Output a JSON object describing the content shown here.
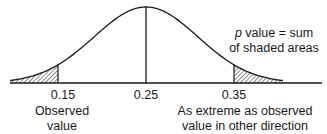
{
  "diagram": {
    "type": "normal-distribution-two-tailed-p-value",
    "ticks": [
      {
        "label": "0.15",
        "x": 58
      },
      {
        "label": "0.25",
        "x": 146
      },
      {
        "label": "0.35",
        "x": 234
      }
    ],
    "annotation": {
      "p_symbol": "p",
      "line1_rest": " value = sum",
      "line2": "of shaded areas"
    },
    "left_caption": {
      "line1": "Observed",
      "line2": "value"
    },
    "right_caption": {
      "line1": "As extreme as observed",
      "line2": "value in other direction"
    },
    "colors": {
      "stroke": "#1a1a1a",
      "background": "#ffffff"
    }
  }
}
